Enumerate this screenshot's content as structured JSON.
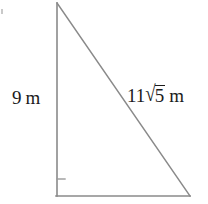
{
  "figure": {
    "kind": "right-triangle-diagram",
    "background_color": "#ffffff",
    "stroke_color": "#8a8a8a",
    "text_color": "#1b1b1b",
    "width": 208,
    "height": 204
  },
  "triangle": {
    "vertices": {
      "apex": {
        "x": 57,
        "y": 3
      },
      "bottom_left": {
        "x": 57,
        "y": 196
      },
      "bottom_right": {
        "x": 190,
        "y": 196
      }
    },
    "right_angle_at": "bottom_left",
    "right_angle_mark": {
      "x": 57,
      "y": 179,
      "length": 8
    }
  },
  "labels": {
    "vertical_leg": {
      "value": "9",
      "unit": "m",
      "text": "9 m"
    },
    "hypotenuse": {
      "coefficient": "11",
      "radical_sign": "√",
      "radicand": "5",
      "unit": "m",
      "text": "11√5 m"
    }
  }
}
